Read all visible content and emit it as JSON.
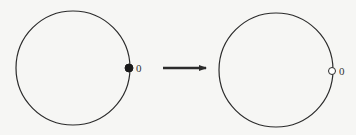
{
  "diagram": {
    "colors": {
      "stroke": "#2b2b2b",
      "background": "#f6f6f4",
      "open_fill": "#ffffff"
    },
    "left": {
      "circle": {
        "cx": 73,
        "cy": 68,
        "r": 57
      },
      "point": {
        "cx": 129,
        "cy": 68,
        "r": 4,
        "style": "filled"
      },
      "label": {
        "text": "0",
        "x": 136,
        "y": 72
      }
    },
    "arrow": {
      "x1": 163,
      "y1": 68,
      "x2": 206,
      "y2": 68,
      "label": ""
    },
    "right": {
      "circle": {
        "cx": 276,
        "cy": 70,
        "r": 57
      },
      "point": {
        "cx": 332,
        "cy": 71,
        "r": 3.5,
        "style": "open"
      },
      "label": {
        "text": "0",
        "x": 339,
        "y": 75
      }
    }
  }
}
